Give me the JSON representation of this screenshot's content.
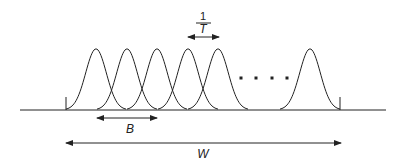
{
  "diagram": {
    "title": "",
    "labels": {
      "spacing_numerator": "1",
      "spacing_denominator": "T",
      "bandwidth_label": "B",
      "total_bandwidth_label": "W"
    },
    "ellipsis": "....",
    "colors": {
      "stroke": "#222222",
      "background": "#ffffff"
    },
    "pulses": {
      "count_visible": 6,
      "centers_x": [
        96,
        127,
        157,
        188,
        218,
        310
      ],
      "half_width": 30,
      "peak_y": 48,
      "baseline_y": 110
    },
    "ellipsis_dots_x": [
      241,
      256,
      272,
      287
    ]
  }
}
